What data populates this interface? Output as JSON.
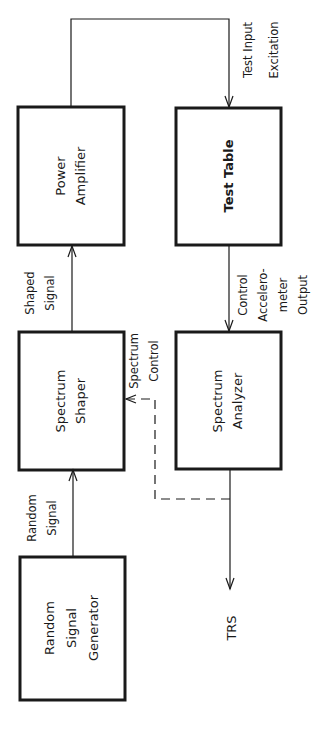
{
  "diagram": {
    "title": "",
    "orientation": "rotated 90 degrees counter-clockwise",
    "blocks": [
      {
        "id": "random_signal_generator",
        "lines": [
          "Random",
          "Signal",
          "Generator"
        ]
      },
      {
        "id": "spectrum_shaper",
        "lines": [
          "Spectrum",
          "Shaper"
        ]
      },
      {
        "id": "power_amplifier",
        "lines": [
          "Power",
          "Amplifier"
        ]
      },
      {
        "id": "test_table",
        "lines": [
          "Test Table"
        ]
      },
      {
        "id": "spectrum_analyzer",
        "lines": [
          "Spectrum",
          "Analyzer"
        ]
      }
    ],
    "edges": [
      {
        "from": "random_signal_generator",
        "to": "spectrum_shaper",
        "label": [
          "Random",
          "Signal"
        ],
        "style": "solid"
      },
      {
        "from": "spectrum_shaper",
        "to": "power_amplifier",
        "label": [
          "Shaped",
          "Signal"
        ],
        "style": "solid"
      },
      {
        "from": "power_amplifier",
        "to": "test_table",
        "label": [
          "Test Input",
          "Excitation"
        ],
        "style": "solid"
      },
      {
        "from": "test_table",
        "to": "spectrum_analyzer",
        "label": [
          "Control",
          "Accelero-",
          "meter",
          "Output"
        ],
        "style": "solid"
      },
      {
        "from": "spectrum_analyzer",
        "to": "spectrum_shaper",
        "label": [
          "Spectrum",
          "Control"
        ],
        "style": "dashed"
      },
      {
        "from": "spectrum_analyzer",
        "to": "trs_output",
        "label": [
          "TRS"
        ],
        "style": "solid"
      }
    ],
    "output_label": "TRS"
  }
}
